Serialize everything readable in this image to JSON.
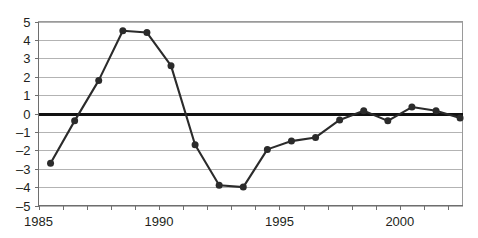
{
  "chart_data": {
    "type": "line",
    "title": "",
    "subtitle": "",
    "xlabel": "",
    "ylabel": "",
    "xlim": [
      1985,
      2002.6
    ],
    "ylim": [
      -5,
      5
    ],
    "grid": true,
    "legend": false,
    "zero_line": true,
    "y_ticks": [
      5,
      4,
      3,
      2,
      1,
      0,
      -1,
      -2,
      -3,
      -4,
      -5
    ],
    "y_tick_labels": [
      "5",
      "4",
      "3",
      "2",
      "1",
      "0",
      "–1",
      "–2",
      "–3",
      "–4",
      "–5"
    ],
    "x_ticks": [
      1985,
      1986,
      1987,
      1988,
      1989,
      1990,
      1991,
      1992,
      1993,
      1994,
      1995,
      1996,
      1997,
      1998,
      1999,
      2000,
      2001,
      2002
    ],
    "x_tick_labels": [
      "1985",
      "",
      "",
      "",
      "",
      "1990",
      "",
      "",
      "",
      "",
      "1995",
      "",
      "",
      "",
      "",
      "2000",
      "",
      ""
    ],
    "x_labeled_ticks": [
      {
        "value": 1985,
        "label": "1985"
      },
      {
        "value": 1990,
        "label": "1990"
      },
      {
        "value": 1995,
        "label": "1995"
      },
      {
        "value": 2000,
        "label": "2000"
      }
    ],
    "series": [
      {
        "name": "series-1",
        "color": "#2b2b2b",
        "marker": "circle",
        "x": [
          1985.5,
          1986.5,
          1987.5,
          1988.5,
          1989.5,
          1990.5,
          1991.5,
          1992.5,
          1993.5,
          1994.5,
          1995.5,
          1996.5,
          1997.5,
          1998.5,
          1999.5,
          2000.5,
          2001.5,
          2002.5
        ],
        "values": [
          -2.7,
          -0.4,
          1.8,
          4.5,
          4.4,
          2.6,
          -1.7,
          -3.9,
          -4.0,
          -1.95,
          -1.5,
          -1.3,
          -0.35,
          0.15,
          -0.4,
          0.35,
          0.15,
          -0.25
        ]
      }
    ]
  },
  "colors": {
    "line": "#2b2b2b",
    "marker": "#2b2b2b",
    "gridline": "#b3b3b3",
    "zero_line": "#111111",
    "axis": "#6e6e6e",
    "text": "#231f20",
    "background": "#ffffff"
  }
}
